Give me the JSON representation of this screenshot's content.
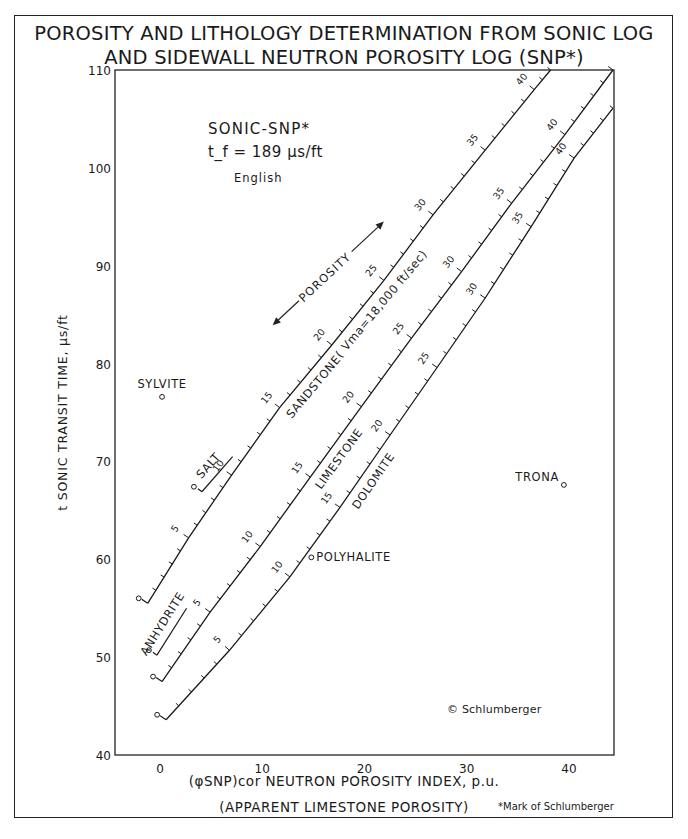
{
  "header": {
    "title_line1": "POROSITY AND LITHOLOGY DETERMINATION FROM SONIC LOG",
    "title_line2": "AND SIDEWALL NEUTRON POROSITY LOG (SNP*)"
  },
  "footer": {
    "xlabel_line1": "(φSNP)cor NEUTRON POROSITY INDEX, p.u.",
    "xlabel_line2": "(APPARENT LIMESTONE POROSITY)",
    "trademark": "*Mark of Schlumberger"
  },
  "chart_data": {
    "type": "line",
    "xlabel": "(φSNP)cor NEUTRON POROSITY INDEX, p.u. (APPARENT LIMESTONE POROSITY)",
    "ylabel": "t SONIC TRANSIT TIME, μs/ft",
    "xlim": [
      -4.4,
      44.4
    ],
    "ylim": [
      40,
      110
    ],
    "xticks": [
      0,
      10,
      20,
      30,
      40
    ],
    "yticks": [
      40,
      50,
      60,
      70,
      80,
      90,
      100,
      110
    ],
    "grid": false,
    "annotations": {
      "chart_name": "SONIC-SNP*",
      "fluid": "t_f = 189 μs/ft",
      "units": "English",
      "porosity_arrow": "POROSITY",
      "copyright": "© Schlumberger"
    },
    "series": [
      {
        "name": "SANDSTONE",
        "label": "SANDSTONE",
        "sublabel": "( Vma=18,000 ft/sec)",
        "porosity_labels": [
          0,
          5,
          10,
          15,
          20,
          25,
          30,
          35,
          40
        ],
        "points": [
          {
            "por": 0,
            "x": -1.2,
            "y": 55.5
          },
          {
            "por": 5,
            "x": 2.8,
            "y": 62.2
          },
          {
            "por": 10,
            "x": 7.0,
            "y": 68.6
          },
          {
            "por": 15,
            "x": 11.7,
            "y": 75.5
          },
          {
            "por": 20,
            "x": 16.8,
            "y": 81.9
          },
          {
            "por": 25,
            "x": 21.9,
            "y": 88.5
          },
          {
            "por": 30,
            "x": 26.7,
            "y": 95.2
          },
          {
            "por": 35,
            "x": 31.8,
            "y": 101.8
          },
          {
            "por": 40,
            "x": 36.6,
            "y": 108.0
          },
          {
            "por": 42,
            "x": 38.2,
            "y": 110.0
          }
        ]
      },
      {
        "name": "LIMESTONE",
        "label": "LIMESTONE",
        "porosity_labels": [
          0,
          5,
          10,
          15,
          20,
          25,
          30,
          35,
          40
        ],
        "points": [
          {
            "por": 0,
            "x": 0.2,
            "y": 47.5
          },
          {
            "por": 5,
            "x": 4.9,
            "y": 54.6
          },
          {
            "por": 10,
            "x": 9.8,
            "y": 61.3
          },
          {
            "por": 15,
            "x": 14.7,
            "y": 68.4
          },
          {
            "por": 20,
            "x": 19.7,
            "y": 75.6
          },
          {
            "por": 25,
            "x": 24.6,
            "y": 82.6
          },
          {
            "por": 30,
            "x": 29.5,
            "y": 89.4
          },
          {
            "por": 35,
            "x": 34.4,
            "y": 96.4
          },
          {
            "por": 40,
            "x": 39.6,
            "y": 103.4
          },
          {
            "por": 45,
            "x": 44.3,
            "y": 110.0
          }
        ]
      },
      {
        "name": "DOLOMITE",
        "label": "DOLOMITE",
        "porosity_labels": [
          0,
          5,
          10,
          15,
          20,
          25,
          30,
          35,
          40
        ],
        "points": [
          {
            "por": 0,
            "x": 0.6,
            "y": 43.6
          },
          {
            "por": 5,
            "x": 6.8,
            "y": 50.7
          },
          {
            "por": 10,
            "x": 12.7,
            "y": 58.2
          },
          {
            "por": 15,
            "x": 17.6,
            "y": 65.3
          },
          {
            "por": 20,
            "x": 22.5,
            "y": 72.7
          },
          {
            "por": 25,
            "x": 27.1,
            "y": 79.6
          },
          {
            "por": 30,
            "x": 31.8,
            "y": 86.7
          },
          {
            "por": 35,
            "x": 36.3,
            "y": 94.0
          },
          {
            "por": 40,
            "x": 40.5,
            "y": 101.0
          },
          {
            "por": 44,
            "x": 44.3,
            "y": 106.1
          }
        ]
      }
    ],
    "mineral_segments": [
      {
        "name": "SALT",
        "start": {
          "x": 4.1,
          "y": 66.9
        },
        "end": {
          "x": 7.1,
          "y": 70.5
        }
      },
      {
        "name": "ANHYDRITE",
        "start": {
          "x": -0.3,
          "y": 50.2
        },
        "end": {
          "x": 2.6,
          "y": 55.0
        }
      }
    ],
    "mineral_points": [
      {
        "name": "SYLVITE",
        "x": 0.2,
        "y": 76.6
      },
      {
        "name": "POLYHALITE",
        "x": 14.8,
        "y": 60.2
      },
      {
        "name": "TRONA",
        "x": 39.5,
        "y": 67.6
      }
    ]
  }
}
